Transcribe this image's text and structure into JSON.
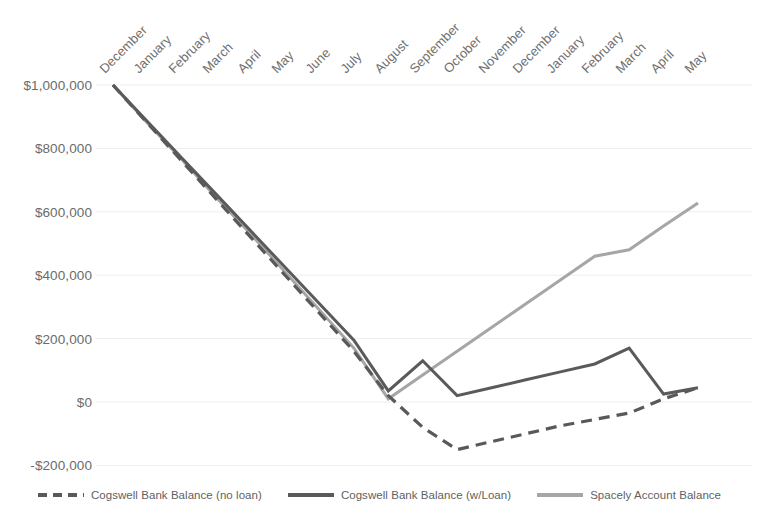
{
  "chart_data": {
    "type": "line",
    "title": "",
    "xlabel": "",
    "ylabel": "",
    "ylim": [
      -200000,
      1000000
    ],
    "ytick_labels": [
      "$1,000,000",
      "$800,000",
      "$600,000",
      "$400,000",
      "$200,000",
      "$0",
      "-$200,000"
    ],
    "ytick_values": [
      1000000,
      800000,
      600000,
      400000,
      200000,
      0,
      -200000
    ],
    "grid": true,
    "grid_axis": "y",
    "legend_position": "bottom",
    "categories": [
      "December",
      "January",
      "February",
      "March",
      "April",
      "May",
      "June",
      "July",
      "August",
      "September",
      "October",
      "November",
      "December",
      "January",
      "February",
      "March",
      "April",
      "May"
    ],
    "series": [
      {
        "name": "Cogswell Bank Balance (no loan)",
        "style": "dashed",
        "color": "#595959",
        "values": [
          1000000,
          880000,
          760000,
          640000,
          520000,
          400000,
          280000,
          160000,
          20000,
          -80000,
          -150000,
          -125000,
          -100000,
          -75000,
          -55000,
          -35000,
          10000,
          45000
        ]
      },
      {
        "name": "Cogswell Bank Balance (w/Loan)",
        "style": "solid",
        "color": "#5a5a5a",
        "values": [
          1000000,
          885000,
          770000,
          655000,
          540000,
          425000,
          310000,
          195000,
          35000,
          130000,
          20000,
          45000,
          70000,
          95000,
          120000,
          170000,
          25000,
          45000
        ]
      },
      {
        "name": "Spacely Account Balance",
        "style": "solid",
        "color": "#a6a6a6",
        "values": [
          1000000,
          880000,
          765000,
          645000,
          530000,
          410000,
          290000,
          170000,
          10000,
          85000,
          160000,
          235000,
          310000,
          385000,
          460000,
          480000,
          555000,
          628000
        ]
      }
    ]
  },
  "legend": {
    "items": [
      {
        "label": "Cogswell Bank Balance (no loan)",
        "style": "dashed",
        "color": "#595959"
      },
      {
        "label": "Cogswell Bank Balance (w/Loan)",
        "style": "solid",
        "color": "#5a5a5a"
      },
      {
        "label": "Spacely Account Balance",
        "style": "solid",
        "color": "#a6a6a6"
      }
    ]
  },
  "colors": {
    "grid": "#eeeeee",
    "tick_text": "#6b6b6b",
    "background": "#ffffff"
  }
}
